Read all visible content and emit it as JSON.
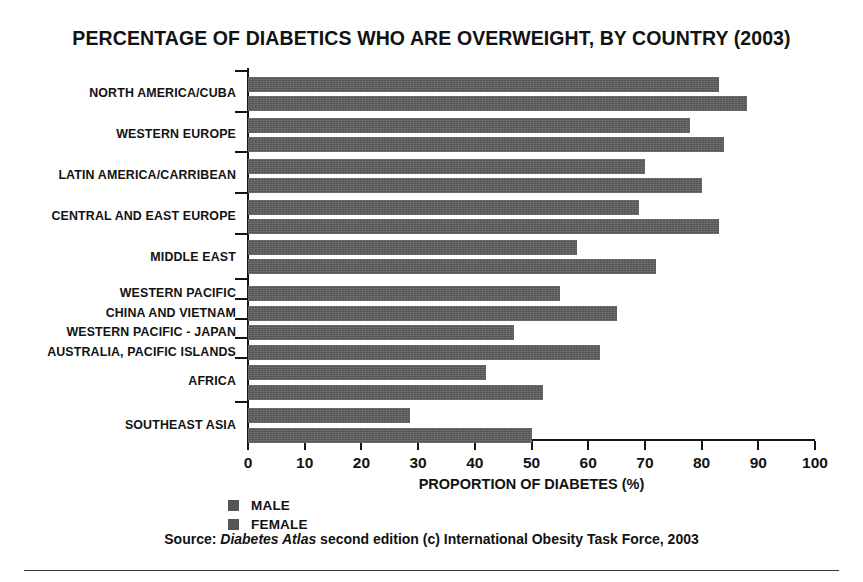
{
  "chart_data": {
    "type": "bar",
    "orientation": "horizontal",
    "title": "PERCENTAGE OF DIABETICS WHO ARE OVERWEIGHT, BY COUNTRY (2003)",
    "xlabel": "PROPORTION OF DIABETES (%)",
    "ylabel": "",
    "xlim": [
      0,
      100
    ],
    "xticks": [
      0,
      10,
      20,
      30,
      40,
      50,
      60,
      70,
      80,
      90,
      100
    ],
    "grid": false,
    "legend_position": "bottom-left",
    "categories": [
      "NORTH AMERICA/CUBA",
      "WESTERN EUROPE",
      "LATIN AMERICA/CARRIBEAN",
      "CENTRAL AND EAST EUROPE",
      "MIDDLE EAST",
      "WESTERN PACIFIC",
      "CHINA AND VIETNAM",
      "WESTERN PACIFIC - JAPAN",
      "AUSTRALIA, PACIFIC ISLANDS",
      "AFRICA",
      "SOUTHEAST ASIA"
    ],
    "series": [
      {
        "name": "MALE",
        "color": "#555555",
        "values": [
          83,
          78,
          70,
          69,
          58,
          55,
          65,
          47,
          62,
          42,
          28.5
        ]
      },
      {
        "name": "FEMALE",
        "color": "#555555",
        "values": [
          88,
          84,
          80,
          83,
          72,
          null,
          null,
          null,
          null,
          52,
          50
        ]
      }
    ],
    "bars": [
      {
        "category": "NORTH AMERICA/CUBA",
        "series": "MALE",
        "value": 83
      },
      {
        "category": "NORTH AMERICA/CUBA",
        "series": "FEMALE",
        "value": 88
      },
      {
        "category": "WESTERN EUROPE",
        "series": "MALE",
        "value": 78
      },
      {
        "category": "WESTERN EUROPE",
        "series": "FEMALE",
        "value": 84
      },
      {
        "category": "LATIN AMERICA/CARRIBEAN",
        "series": "MALE",
        "value": 70
      },
      {
        "category": "LATIN AMERICA/CARRIBEAN",
        "series": "FEMALE",
        "value": 80
      },
      {
        "category": "CENTRAL AND EAST EUROPE",
        "series": "MALE",
        "value": 69
      },
      {
        "category": "CENTRAL AND EAST EUROPE",
        "series": "FEMALE",
        "value": 83
      },
      {
        "category": "MIDDLE EAST",
        "series": "MALE",
        "value": 58
      },
      {
        "category": "MIDDLE EAST",
        "series": "FEMALE",
        "value": 72
      },
      {
        "category": "WESTERN PACIFIC",
        "series": "MALE",
        "value": 55
      },
      {
        "category": "CHINA AND VIETNAM",
        "series": "FEMALE",
        "value": 65
      },
      {
        "category": "WESTERN PACIFIC - JAPAN",
        "series": "MALE",
        "value": 47
      },
      {
        "category": "AUSTRALIA, PACIFIC ISLANDS",
        "series": "FEMALE",
        "value": 62
      },
      {
        "category": "AFRICA",
        "series": "MALE",
        "value": 42
      },
      {
        "category": "AFRICA",
        "series": "FEMALE",
        "value": 52
      },
      {
        "category": "SOUTHEAST ASIA",
        "series": "MALE",
        "value": 28.5
      },
      {
        "category": "SOUTHEAST ASIA",
        "series": "FEMALE",
        "value": 50
      }
    ]
  },
  "legend": {
    "items": [
      {
        "label": "MALE",
        "color": "#555555"
      },
      {
        "label": "FEMALE",
        "color": "#555555"
      }
    ]
  },
  "source": {
    "prefix": "Source: ",
    "italic": "Diabetes Atlas",
    "suffix": " second edition (c) International Obesity Task Force, 2003"
  }
}
